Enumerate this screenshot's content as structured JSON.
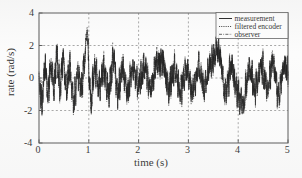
{
  "chart_data": {
    "type": "line",
    "title": "",
    "xlabel": "time (s)",
    "ylabel": "rate (rad/s)",
    "xlim": [
      0,
      5
    ],
    "ylim": [
      -4,
      4
    ],
    "xticks": [
      "0",
      "1",
      "2",
      "3",
      "4",
      "5"
    ],
    "yticks": [
      "4",
      "2",
      "0",
      "-2",
      "-4"
    ],
    "grid": true,
    "grid_style": "dashed",
    "legend_position": "top-right",
    "series": [
      {
        "name": "measurement",
        "style": "solid",
        "color": "#1a1a1a",
        "description": "Dense broadband noisy angular rate signal, zero mean, typical envelope +/-1.5 rad/s, with large transient spike to about 3.7 rad/s near t = 0.97 s and deep negative excursions to about -2.1 rad/s near t = 0.7 s and t = 4.1 s.",
        "sample_points": [
          {
            "t": 0.0,
            "v": 0.1
          },
          {
            "t": 0.06,
            "v": -1.95
          },
          {
            "t": 0.12,
            "v": 1.05
          },
          {
            "t": 0.18,
            "v": -1.2
          },
          {
            "t": 0.24,
            "v": 1.45
          },
          {
            "t": 0.3,
            "v": -0.95
          },
          {
            "t": 0.36,
            "v": 1.95
          },
          {
            "t": 0.42,
            "v": -1.3
          },
          {
            "t": 0.48,
            "v": 1.6
          },
          {
            "t": 0.55,
            "v": -1.1
          },
          {
            "t": 0.62,
            "v": 0.95
          },
          {
            "t": 0.7,
            "v": -2.1
          },
          {
            "t": 0.78,
            "v": 0.6
          },
          {
            "t": 0.85,
            "v": -1.05
          },
          {
            "t": 0.92,
            "v": 1.6
          },
          {
            "t": 0.97,
            "v": 3.7
          },
          {
            "t": 1.0,
            "v": 0.4
          },
          {
            "t": 1.05,
            "v": -1.7
          },
          {
            "t": 1.12,
            "v": 1.1
          },
          {
            "t": 1.2,
            "v": -0.85
          },
          {
            "t": 1.3,
            "v": 0.9
          },
          {
            "t": 1.4,
            "v": -1.15
          },
          {
            "t": 1.5,
            "v": 1.75
          },
          {
            "t": 1.58,
            "v": -1.35
          },
          {
            "t": 1.68,
            "v": 0.75
          },
          {
            "t": 1.78,
            "v": -1.2
          },
          {
            "t": 1.88,
            "v": 0.85
          },
          {
            "t": 2.0,
            "v": -0.7
          },
          {
            "t": 2.12,
            "v": 0.95
          },
          {
            "t": 2.24,
            "v": -0.9
          },
          {
            "t": 2.36,
            "v": 1.1
          },
          {
            "t": 2.48,
            "v": 1.4
          },
          {
            "t": 2.6,
            "v": -1.0
          },
          {
            "t": 2.72,
            "v": 0.8
          },
          {
            "t": 2.84,
            "v": -0.95
          },
          {
            "t": 2.96,
            "v": 0.7
          },
          {
            "t": 3.08,
            "v": -1.05
          },
          {
            "t": 3.2,
            "v": 0.85
          },
          {
            "t": 3.32,
            "v": -0.8
          },
          {
            "t": 3.44,
            "v": 1.0
          },
          {
            "t": 3.56,
            "v": 2.1
          },
          {
            "t": 3.64,
            "v": 1.7
          },
          {
            "t": 3.74,
            "v": -1.35
          },
          {
            "t": 3.86,
            "v": 0.9
          },
          {
            "t": 3.98,
            "v": -1.1
          },
          {
            "t": 4.1,
            "v": -2.0
          },
          {
            "t": 4.22,
            "v": 0.95
          },
          {
            "t": 4.34,
            "v": -1.15
          },
          {
            "t": 4.46,
            "v": 1.05
          },
          {
            "t": 4.58,
            "v": -0.9
          },
          {
            "t": 4.7,
            "v": 1.2
          },
          {
            "t": 4.82,
            "v": -1.45
          },
          {
            "t": 4.92,
            "v": 1.05
          },
          {
            "t": 5.0,
            "v": 0.3
          }
        ]
      },
      {
        "name": "filtered encoder",
        "style": "dotted",
        "color": "#3a3a3a",
        "description": "Closely overlays the measurement trace with slightly smaller high frequency content."
      },
      {
        "name": "observer",
        "style": "dash-dot",
        "color": "#555555",
        "description": "Closely overlays the measurement and filtered encoder traces."
      }
    ]
  },
  "legend": {
    "items": [
      {
        "label": "measurement",
        "style": "solid"
      },
      {
        "label": "filtered encoder",
        "style": "dotted"
      },
      {
        "label": "observer",
        "style": "dash-dot"
      }
    ]
  },
  "colors": {
    "axis": "#3c3c3c",
    "grid": "#7a7a7a",
    "trace": "#1a1a1a",
    "background": "#fdfdfd",
    "text": "#1d1d1d"
  }
}
